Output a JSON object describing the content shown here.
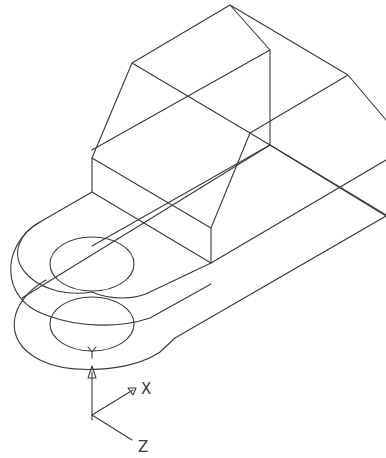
{
  "drawing": {
    "type": "isometric-wireframe",
    "stroke_color": "#3a3a3a",
    "background": "#ffffff"
  },
  "ucs_icon": {
    "labels": {
      "x": "X",
      "y": "Y",
      "z": "Z"
    }
  }
}
